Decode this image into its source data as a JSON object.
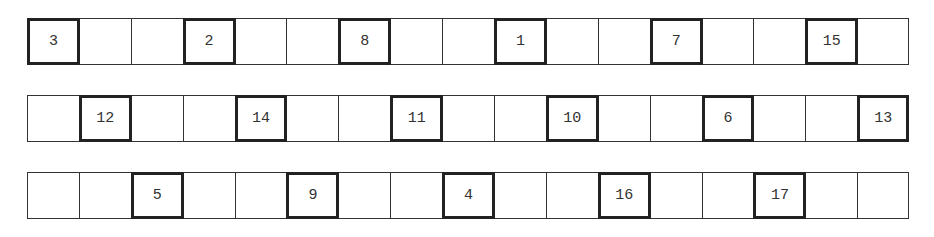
{
  "grid": {
    "columns": 17,
    "rows": [
      {
        "top": 18,
        "cells": [
          "3",
          "",
          "",
          "2",
          "",
          "",
          "8",
          "",
          "",
          "1",
          "",
          "",
          "7",
          "",
          "",
          "15",
          ""
        ]
      },
      {
        "top": 95,
        "cells": [
          "",
          "12",
          "",
          "",
          "14",
          "",
          "",
          "11",
          "",
          "",
          "10",
          "",
          "",
          "6",
          "",
          "",
          "13"
        ]
      },
      {
        "top": 172,
        "cells": [
          "",
          "",
          "5",
          "",
          "",
          "9",
          "",
          "",
          "4",
          "",
          "",
          "16",
          "",
          "",
          "17",
          "",
          ""
        ]
      }
    ]
  }
}
